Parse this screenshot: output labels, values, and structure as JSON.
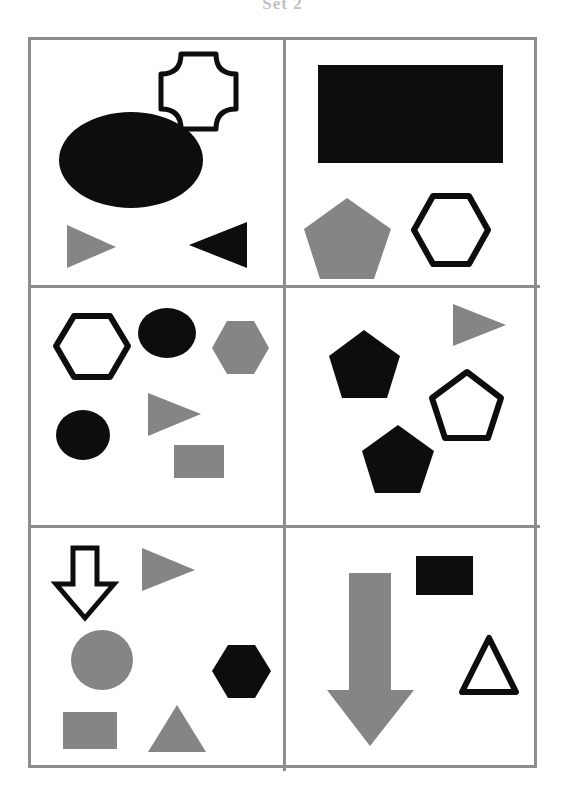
{
  "figure": {
    "caption": "Set 2",
    "width": 565,
    "height": 802,
    "background": "#ffffff"
  },
  "colors": {
    "black": "#0d0d0d",
    "gray": "#858585",
    "white": "#ffffff",
    "border": "#8d8d8d",
    "outline": "#0d0d0d"
  },
  "grid": {
    "rows": 3,
    "columns": 2,
    "frame": {
      "left": 28,
      "top": 37,
      "width": 509,
      "height": 731
    },
    "border_width": 3,
    "divider_width": 3,
    "column_split_x": 255,
    "row_split_1_y": 248,
    "row_split_2_y": 488
  },
  "panels": [
    {
      "id": "panel-1",
      "position": "top-left",
      "row": 1,
      "column": 1,
      "shape_count": 4,
      "shapes": [
        {
          "name": "cross-outline",
          "kind": "cross",
          "fill": "none",
          "stroke": "#0d0d0d",
          "label": "outlined concave cross"
        },
        {
          "name": "ellipse-black",
          "kind": "ellipse",
          "fill": "#0d0d0d",
          "stroke": "none",
          "label": "large black ellipse"
        },
        {
          "name": "triangle-right-gray",
          "kind": "triangle-right",
          "fill": "#858585",
          "stroke": "none",
          "label": "gray right-pointing triangle"
        },
        {
          "name": "triangle-left-black",
          "kind": "triangle-left",
          "fill": "#0d0d0d",
          "stroke": "none",
          "label": "black left-pointing triangle"
        }
      ]
    },
    {
      "id": "panel-2",
      "position": "top-right",
      "row": 1,
      "column": 2,
      "shape_count": 3,
      "shapes": [
        {
          "name": "rectangle-black",
          "kind": "rectangle",
          "fill": "#0d0d0d",
          "stroke": "none",
          "label": "large black rectangle"
        },
        {
          "name": "pentagon-gray",
          "kind": "pentagon",
          "fill": "#858585",
          "stroke": "none",
          "label": "gray pentagon"
        },
        {
          "name": "hexagon-outline",
          "kind": "hexagon",
          "fill": "none",
          "stroke": "#0d0d0d",
          "label": "outlined hexagon"
        }
      ]
    },
    {
      "id": "panel-3",
      "position": "middle-left",
      "row": 2,
      "column": 1,
      "shape_count": 6,
      "shapes": [
        {
          "name": "hexagon-outline",
          "kind": "hexagon",
          "fill": "none",
          "stroke": "#0d0d0d",
          "label": "outlined hexagon"
        },
        {
          "name": "ellipse-black-upper",
          "kind": "ellipse",
          "fill": "#0d0d0d",
          "stroke": "none",
          "label": "black ellipse"
        },
        {
          "name": "hexagon-gray",
          "kind": "hexagon",
          "fill": "#858585",
          "stroke": "none",
          "label": "gray hexagon"
        },
        {
          "name": "ellipse-black-lower",
          "kind": "ellipse",
          "fill": "#0d0d0d",
          "stroke": "none",
          "label": "black ellipse"
        },
        {
          "name": "triangle-right-gray",
          "kind": "triangle-right",
          "fill": "#858585",
          "stroke": "none",
          "label": "gray right-pointing triangle"
        },
        {
          "name": "rectangle-gray",
          "kind": "rectangle",
          "fill": "#858585",
          "stroke": "none",
          "label": "gray rectangle"
        }
      ]
    },
    {
      "id": "panel-4",
      "position": "middle-right",
      "row": 2,
      "column": 2,
      "shape_count": 4,
      "shapes": [
        {
          "name": "triangle-right-gray",
          "kind": "triangle-right",
          "fill": "#858585",
          "stroke": "none",
          "label": "gray right-pointing triangle"
        },
        {
          "name": "pentagon-black-upper",
          "kind": "pentagon",
          "fill": "#0d0d0d",
          "stroke": "none",
          "label": "black pentagon"
        },
        {
          "name": "pentagon-outline",
          "kind": "pentagon",
          "fill": "none",
          "stroke": "#0d0d0d",
          "label": "outlined pentagon"
        },
        {
          "name": "pentagon-black-lower",
          "kind": "pentagon",
          "fill": "#0d0d0d",
          "stroke": "none",
          "label": "black pentagon"
        }
      ]
    },
    {
      "id": "panel-5",
      "position": "bottom-left",
      "row": 3,
      "column": 1,
      "shape_count": 6,
      "shapes": [
        {
          "name": "arrow-down-outline",
          "kind": "arrow-down",
          "fill": "none",
          "stroke": "#0d0d0d",
          "label": "outlined downward arrow"
        },
        {
          "name": "triangle-right-gray",
          "kind": "triangle-right",
          "fill": "#858585",
          "stroke": "none",
          "label": "gray right-pointing triangle"
        },
        {
          "name": "ellipse-gray",
          "kind": "ellipse",
          "fill": "#858585",
          "stroke": "none",
          "label": "gray circle"
        },
        {
          "name": "hexagon-black",
          "kind": "hexagon",
          "fill": "#0d0d0d",
          "stroke": "none",
          "label": "black hexagon"
        },
        {
          "name": "rectangle-gray",
          "kind": "rectangle",
          "fill": "#858585",
          "stroke": "none",
          "label": "gray rectangle"
        },
        {
          "name": "triangle-up-gray",
          "kind": "triangle-up",
          "fill": "#858585",
          "stroke": "none",
          "label": "gray upward triangle"
        }
      ]
    },
    {
      "id": "panel-6",
      "position": "bottom-right",
      "row": 3,
      "column": 2,
      "shape_count": 3,
      "shapes": [
        {
          "name": "arrow-down-gray",
          "kind": "arrow-down",
          "fill": "#858585",
          "stroke": "none",
          "label": "large gray downward arrow"
        },
        {
          "name": "rectangle-black",
          "kind": "rectangle",
          "fill": "#0d0d0d",
          "stroke": "none",
          "label": "black rectangle"
        },
        {
          "name": "triangle-up-outline",
          "kind": "triangle-up",
          "fill": "none",
          "stroke": "#0d0d0d",
          "label": "outlined upward triangle"
        }
      ]
    }
  ]
}
